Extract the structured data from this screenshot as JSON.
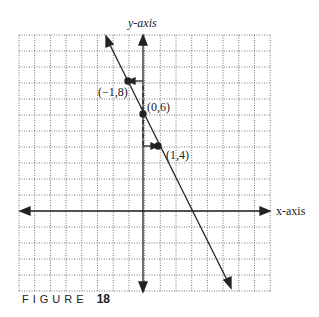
{
  "chart_data": {
    "type": "line",
    "title": "",
    "xlabel": "x-axis",
    "ylabel": "y-axis",
    "xlim": [
      -8,
      8
    ],
    "ylim": [
      -5,
      11
    ],
    "grid": true,
    "series": [
      {
        "name": "y = -2x + 6",
        "x": [
          -2.3,
          5.6
        ],
        "y": [
          10.6,
          -5.2
        ]
      }
    ],
    "points": [
      {
        "x": -1,
        "y": 8,
        "label": "(-1,8)"
      },
      {
        "x": 0,
        "y": 6,
        "label": "(0,6)"
      },
      {
        "x": 1,
        "y": 4,
        "label": "(1,4)"
      }
    ]
  },
  "labels": {
    "yaxis": "y-axis",
    "xaxis": "x-axis",
    "p1": "(−1,8)",
    "p2": "(0,6)",
    "p3": "(1,4)"
  },
  "caption": {
    "word": "FIGURE",
    "num": "18"
  }
}
